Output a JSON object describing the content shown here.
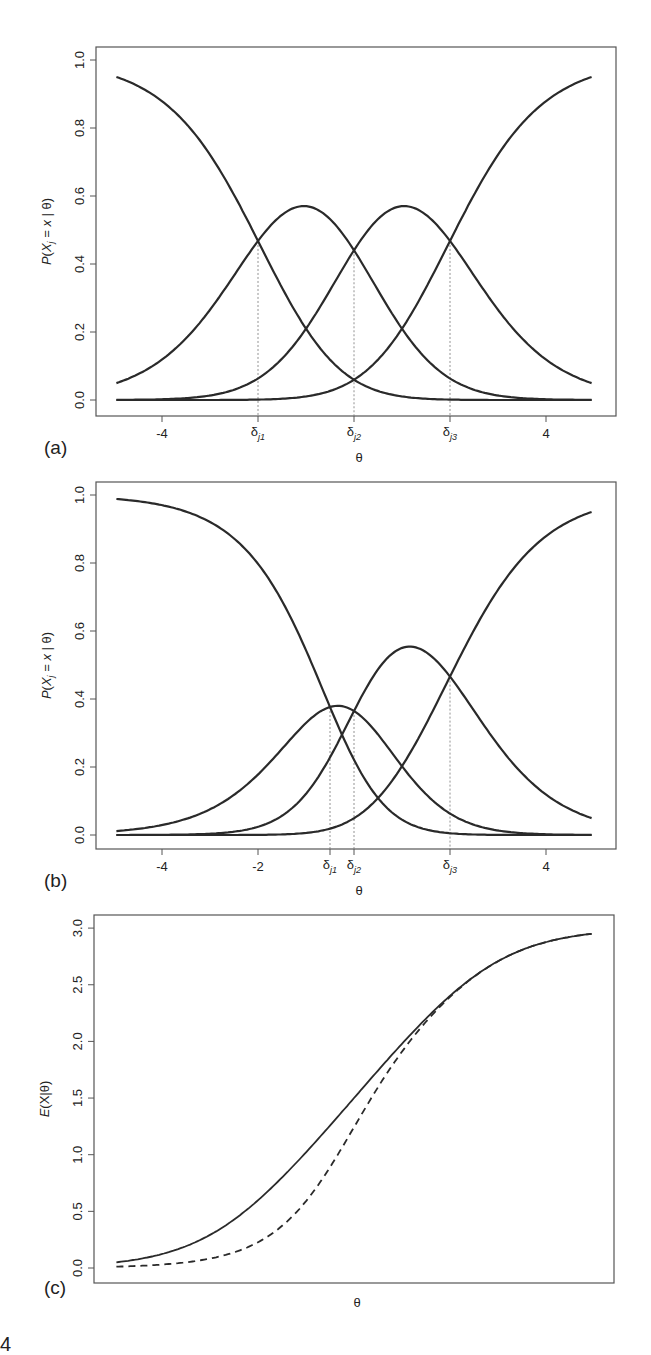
{
  "figure": {
    "panels": [
      {
        "label": "(a)",
        "ylabel": "P(X_j = x | θ)",
        "xlabel": "θ"
      },
      {
        "label": "(b)",
        "ylabel": "P(X_j = x | θ)",
        "xlabel": "θ"
      },
      {
        "label": "(c)",
        "ylabel": "E(X|θ)",
        "xlabel": "θ"
      }
    ],
    "figure_number_fragment": "4"
  },
  "colors": {
    "curve": "#2a2a2a",
    "frame": "#555555",
    "dashed_guide": "#777777",
    "text": "#222222"
  },
  "chart_data": [
    {
      "type": "line",
      "panel": "(a)",
      "title": "",
      "xlabel": "θ",
      "ylabel": "P(X_j = x | θ)",
      "xlim": [
        -5,
        5
      ],
      "ylim": [
        0,
        1
      ],
      "x_ticks": [
        -4,
        4
      ],
      "x_tick_annotations": [
        {
          "label": "δj1",
          "x": -2
        },
        {
          "label": "δj2",
          "x": 0
        },
        {
          "label": "δj3",
          "x": 2
        }
      ],
      "y_ticks": [
        "0.0",
        "0.2",
        "0.4",
        "0.6",
        "0.8",
        "1.0"
      ],
      "model": "partial credit, 4 categories",
      "thresholds": [
        -2,
        0,
        2
      ],
      "series": [
        {
          "name": "x=0",
          "values_at": {
            "-5": 0.95,
            "-2": 0.47,
            "0": 0.04,
            "5": 0.0
          }
        },
        {
          "name": "x=1",
          "values_at": {
            "-5": 0.05,
            "-2": 0.47,
            "-1": 0.565,
            "0": 0.44,
            "5": 0.0
          }
        },
        {
          "name": "x=2",
          "values_at": {
            "-5": 0.0,
            "0": 0.44,
            "1": 0.565,
            "2": 0.47,
            "5": 0.05
          }
        },
        {
          "name": "x=3",
          "values_at": {
            "-5": 0.0,
            "0": 0.04,
            "2": 0.47,
            "5": 0.95
          }
        }
      ],
      "grid": false,
      "legend": "none"
    },
    {
      "type": "line",
      "panel": "(b)",
      "title": "",
      "xlabel": "θ",
      "ylabel": "P(X_j = x | θ)",
      "xlim": [
        -5,
        5
      ],
      "ylim": [
        0,
        1
      ],
      "x_ticks": [
        -4,
        -2,
        4
      ],
      "x_tick_annotations": [
        {
          "label": "δj1",
          "x": -0.5
        },
        {
          "label": "δj2",
          "x": 0
        },
        {
          "label": "δj3",
          "x": 2
        }
      ],
      "y_ticks": [
        "0.0",
        "0.2",
        "0.4",
        "0.6",
        "0.8",
        "1.0"
      ],
      "model": "partial credit, 4 categories",
      "thresholds": [
        -0.5,
        0,
        2
      ],
      "series": [
        {
          "name": "x=0",
          "values_at": {
            "-5": 0.99,
            "-0.5": 0.37,
            "5": 0.0
          }
        },
        {
          "name": "x=1",
          "values_at": {
            "-5": 0.01,
            "-0.5": 0.37,
            "-0.25": 0.375,
            "0": 0.35,
            "5": 0.0
          }
        },
        {
          "name": "x=2",
          "values_at": {
            "-5": 0.0,
            "0": 0.35,
            "1": 0.55,
            "2": 0.46,
            "5": 0.05
          }
        },
        {
          "name": "x=3",
          "values_at": {
            "-5": 0.0,
            "2": 0.46,
            "5": 0.95
          }
        }
      ],
      "grid": false,
      "legend": "none"
    },
    {
      "type": "line",
      "panel": "(c)",
      "title": "",
      "xlabel": "θ",
      "ylabel": "E(X|θ)",
      "xlim": [
        -5,
        5
      ],
      "ylim": [
        0,
        3
      ],
      "x_ticks": [],
      "y_ticks": [
        "0.0",
        "0.5",
        "1.0",
        "1.5",
        "2.0",
        "2.5",
        "3.0"
      ],
      "series": [
        {
          "name": "solid (thresholds -2, 0, 2)",
          "style": "solid",
          "thresholds": [
            -2,
            0,
            2
          ],
          "values_at": {
            "-5": 0.05,
            "0": 1.5,
            "5": 2.95
          }
        },
        {
          "name": "dashed (thresholds -0.5, 0, 2)",
          "style": "dashed",
          "thresholds": [
            -0.5,
            0,
            2
          ],
          "values_at": {
            "-5": 0.01,
            "0": 1.2,
            "5": 2.95
          }
        }
      ],
      "grid": false,
      "legend": "none"
    }
  ]
}
